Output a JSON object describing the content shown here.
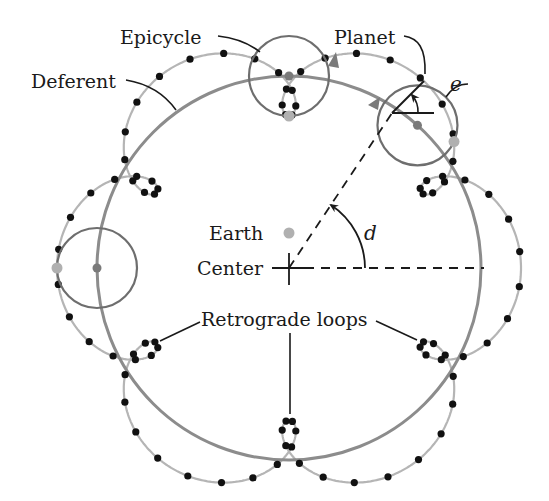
{
  "diagram": {
    "labels": {
      "epicycle": "Epicycle",
      "planet": "Planet",
      "deferent": "Deferent",
      "earth": "Earth",
      "center": "Center",
      "retrograde": "Retrograde loops",
      "angle_e": "e",
      "angle_d": "d"
    },
    "geometry": {
      "center": [
        289,
        268
      ],
      "earth": [
        289,
        233
      ],
      "deferent_radius": 192,
      "epicycle_radius": 40,
      "epicycle_speed_ratio": 7,
      "trajectory_samples": 84,
      "planet_angle_deg": 48,
      "epicycle_positions_deg": [
        90,
        48,
        180
      ]
    },
    "colors": {
      "deferent": "#8c8c8c",
      "epicycle": "#6e6e6e",
      "trajectory": "#b5b5b5",
      "dots": "#111111",
      "planet": "#b0b0b0",
      "earth": "#b0b0b0",
      "epicycle_center": "#7a7a7a",
      "ink": "#1a1a1a"
    }
  }
}
